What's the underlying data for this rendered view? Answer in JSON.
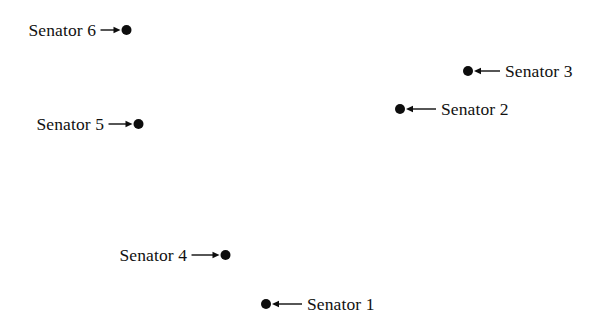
{
  "chart_data": {
    "type": "scatter",
    "title": "",
    "subtitle": "",
    "xlabel": "",
    "ylabel": "",
    "grid": false,
    "legend": "none",
    "axes_visible": false,
    "background_color": "#ffffff",
    "point_color": "#0d0d0d",
    "point_diameter_px": 10,
    "xlim": [
      0,
      607
    ],
    "ylim": [
      0,
      319
    ],
    "y_axis_direction": "down",
    "units": "pixels",
    "annotation_style": "label with straight leader arrow pointing to data point",
    "categories": [
      "Senator 1",
      "Senator 2",
      "Senator 3",
      "Senator 4",
      "Senator 5",
      "Senator 6"
    ],
    "x": [
      266,
      400,
      468,
      226,
      139,
      127
    ],
    "y": [
      304,
      109,
      71,
      255,
      124,
      30
    ],
    "points": [
      {
        "label": "Senator 1",
        "x": 266,
        "y": 304,
        "label_side": "right",
        "arrow_direction": "left",
        "leader_length_px": 30
      },
      {
        "label": "Senator 2",
        "x": 400,
        "y": 109,
        "label_side": "right",
        "arrow_direction": "left",
        "leader_length_px": 30
      },
      {
        "label": "Senator 3",
        "x": 468,
        "y": 71,
        "label_side": "right",
        "arrow_direction": "left",
        "leader_length_px": 26
      },
      {
        "label": "Senator 4",
        "x": 226,
        "y": 255,
        "label_side": "left",
        "arrow_direction": "right",
        "leader_length_px": 28
      },
      {
        "label": "Senator 5",
        "x": 139,
        "y": 124,
        "label_side": "left",
        "arrow_direction": "right",
        "leader_length_px": 24
      },
      {
        "label": "Senator 6",
        "x": 127,
        "y": 30,
        "label_side": "left",
        "arrow_direction": "right",
        "leader_length_px": 20
      }
    ]
  },
  "figure": {
    "width": 607,
    "height": 319
  }
}
